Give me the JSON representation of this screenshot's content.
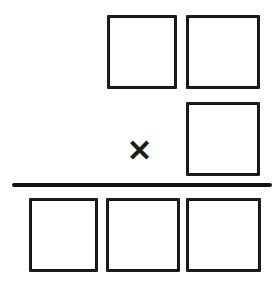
{
  "figure": {
    "width": 278,
    "height": 287,
    "background_color": "#ffffff",
    "stroke_color": "#1c1c1c"
  },
  "operator": {
    "symbol": "✕",
    "name": "multiplication-sign",
    "label": "times",
    "x": 139,
    "y": 151,
    "font_size": 30,
    "color": "#1c1c1c"
  },
  "fraction_bar": {
    "name": "division-bar",
    "x": 12,
    "y": 183,
    "width": 260,
    "height": 4,
    "color": "#121212"
  },
  "numerator_boxes": [
    {
      "id": "num-box-1",
      "label": "",
      "value": "",
      "x": 107,
      "y": 15,
      "width": 70,
      "height": 74
    },
    {
      "id": "num-box-2",
      "label": "",
      "value": "",
      "x": 186,
      "y": 15,
      "width": 74,
      "height": 74
    },
    {
      "id": "num-box-3",
      "label": "",
      "value": "",
      "x": 186,
      "y": 102,
      "width": 74,
      "height": 74
    }
  ],
  "denominator_boxes": [
    {
      "id": "den-box-1",
      "label": "",
      "value": "",
      "x": 29,
      "y": 198,
      "width": 69,
      "height": 74
    },
    {
      "id": "den-box-2",
      "label": "",
      "value": "",
      "x": 106,
      "y": 198,
      "width": 74,
      "height": 74
    },
    {
      "id": "den-box-3",
      "label": "",
      "value": "",
      "x": 186,
      "y": 198,
      "width": 75,
      "height": 74
    }
  ]
}
